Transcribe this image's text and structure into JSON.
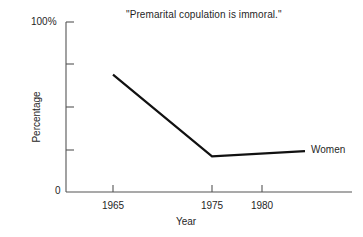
{
  "chart_data": {
    "type": "line",
    "title": "\"Premarital copulation is immoral.\"",
    "xlabel": "Year",
    "ylabel": "Percentage",
    "x": [
      1965,
      1975,
      1980
    ],
    "xticklabels": [
      "1965",
      "1975",
      "1980"
    ],
    "xlim": [
      1962,
      1984
    ],
    "ylim": [
      0,
      100
    ],
    "yticks": [
      0,
      25,
      50,
      75,
      100
    ],
    "yticklabels": [
      "0",
      "",
      "",
      "",
      "100%"
    ],
    "ytick_min_label": "0",
    "ytick_max_label": "100%",
    "grid": false,
    "legend_position": "right-inline",
    "series": [
      {
        "name": "Women",
        "label": "Women",
        "color": "#111111",
        "values": [
          69,
          21,
          24
        ]
      }
    ],
    "annotations": [
      {
        "name": "series-end-label",
        "text": "Women",
        "x": 1980,
        "y": 24
      }
    ]
  },
  "colors": {
    "background": "#ffffff",
    "axis": "#555555",
    "line": "#111111",
    "text": "#1f1f1f"
  }
}
